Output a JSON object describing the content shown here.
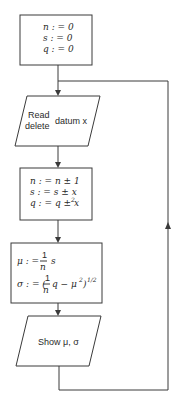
{
  "diagram": {
    "type": "flowchart",
    "nodes": [
      {
        "id": "init",
        "shape": "rectangle",
        "lines": [
          "n : = 0",
          "s : = 0",
          "q : = 0"
        ]
      },
      {
        "id": "read",
        "shape": "parallelogram",
        "left_lines": [
          "Read",
          "delete"
        ],
        "right_text": "datum x"
      },
      {
        "id": "update",
        "shape": "rectangle",
        "lines": [
          "n : = n ± 1",
          "s : = s ± x",
          "q : = q ± x"
        ],
        "superscript": "2"
      },
      {
        "id": "compute",
        "shape": "rectangle",
        "mu_line": {
          "lhs": "μ : =",
          "frac_num": "1",
          "frac_den": "n",
          "rhs": "s"
        },
        "sigma_line": {
          "lhs": "σ : = (",
          "frac_num": "1",
          "frac_den": "n",
          "rhs": "q − μ",
          "sq": "2",
          "close": ")",
          "exp": "1/2"
        }
      },
      {
        "id": "show",
        "shape": "parallelogram",
        "text": "Show μ, σ"
      }
    ],
    "edges": [
      {
        "from": "init",
        "to": "read"
      },
      {
        "from": "read",
        "to": "update"
      },
      {
        "from": "update",
        "to": "compute"
      },
      {
        "from": "compute",
        "to": "show"
      },
      {
        "from": "show",
        "to": "read",
        "note": "loop back via right side"
      }
    ],
    "colors": {
      "stroke": "#3a3a3a",
      "text": "#2a2a2a",
      "background": "#ffffff"
    }
  }
}
